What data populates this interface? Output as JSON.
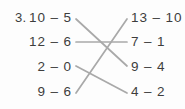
{
  "worksheet": {
    "question_number": "3.",
    "instruction_type": "matching-lines",
    "colors": {
      "text": "#3d3d3d",
      "line": "#a9a9a9",
      "background": "#fdfdfd"
    },
    "left_column": [
      {
        "id": "L1",
        "text": "10 – 5",
        "minuend": 10,
        "subtrahend": 5,
        "value": 5
      },
      {
        "id": "L2",
        "text": "12 – 6",
        "minuend": 12,
        "subtrahend": 6,
        "value": 6
      },
      {
        "id": "L3",
        "text": "2 – 0",
        "minuend": 2,
        "subtrahend": 0,
        "value": 2
      },
      {
        "id": "L4",
        "text": "9 – 6",
        "minuend": 9,
        "subtrahend": 6,
        "value": 3
      }
    ],
    "right_column": [
      {
        "id": "R1",
        "text": "13 – 10",
        "minuend": 13,
        "subtrahend": 10,
        "value": 3
      },
      {
        "id": "R2",
        "text": "7 – 1",
        "minuend": 7,
        "subtrahend": 1,
        "value": 6
      },
      {
        "id": "R3",
        "text": "9 – 4",
        "minuend": 9,
        "subtrahend": 4,
        "value": 5
      },
      {
        "id": "R4",
        "text": "4 – 2",
        "minuend": 4,
        "subtrahend": 2,
        "value": 2
      }
    ],
    "connections": [
      {
        "from": "L1",
        "to": "R3",
        "x1": 76,
        "y1": 19,
        "x2": 127,
        "y2": 66
      },
      {
        "from": "L2",
        "to": "R2",
        "x1": 76,
        "y1": 42,
        "x2": 127,
        "y2": 42
      },
      {
        "from": "L3",
        "to": "R4",
        "x1": 76,
        "y1": 66,
        "x2": 127,
        "y2": 93
      },
      {
        "from": "L4",
        "to": "R1",
        "x1": 76,
        "y1": 93,
        "x2": 127,
        "y2": 19
      }
    ]
  }
}
